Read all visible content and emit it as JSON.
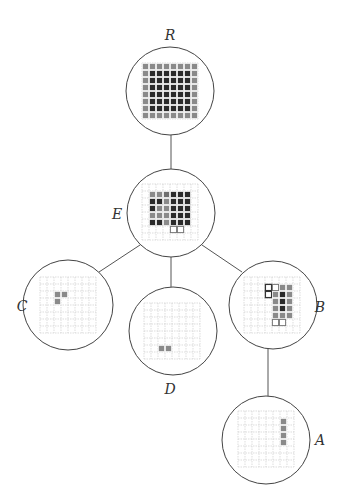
{
  "diagram": {
    "type": "tree",
    "colors": {
      "dark": "#2a2a2a",
      "gray": "#8a8a8a",
      "mid": "#6e6e6e",
      "grid": "#c8c8c8",
      "edge": "#555555",
      "circle": "#444444",
      "outline": "#777777"
    },
    "nodes": [
      {
        "id": "R",
        "label": "R",
        "cx": 170,
        "cy": 91,
        "r": 44,
        "labelX": 170,
        "labelY": 40,
        "grid": {
          "x": 142,
          "y": 63,
          "size": 7,
          "n": 8
        },
        "cells": [
          "gggggggg",
          "gddddddg",
          "gddddddg",
          "gddddddg",
          "gddddddg",
          "gddddddg",
          "gddddddg",
          "gggggggg"
        ]
      },
      {
        "id": "E",
        "label": "E",
        "cx": 171,
        "cy": 213,
        "r": 44,
        "labelX": 117,
        "labelY": 219,
        "grid": {
          "x": 142,
          "y": 184,
          "size": 7,
          "n": 8
        },
        "cells": [
          "........",
          ".ggmddd.",
          ".ddgddd.",
          ".dggddd.",
          ".gggddd.",
          ".ddgddd.",
          "....oo..",
          "........"
        ]
      },
      {
        "id": "C",
        "label": "C",
        "cx": 68,
        "cy": 305,
        "r": 45,
        "labelX": 22,
        "labelY": 311,
        "grid": {
          "x": 40,
          "y": 277,
          "size": 7,
          "n": 8
        },
        "cells": [
          "........",
          "........",
          "..gg....",
          "..g.....",
          "........",
          "........",
          "........",
          "........"
        ]
      },
      {
        "id": "D",
        "label": "D",
        "cx": 173,
        "cy": 331,
        "r": 44,
        "labelX": 170,
        "labelY": 394,
        "grid": {
          "x": 144,
          "y": 303,
          "size": 7,
          "n": 8
        },
        "cells": [
          "........",
          "........",
          "........",
          "........",
          "........",
          "........",
          "..gg....",
          "........"
        ]
      },
      {
        "id": "B",
        "label": "B",
        "cx": 273,
        "cy": 305,
        "r": 44,
        "labelX": 320,
        "labelY": 312,
        "grid": {
          "x": 244,
          "y": 277,
          "size": 7,
          "n": 8
        },
        "cells": [
          "........",
          "...Oogg.",
          "...Ogdg.",
          "....gdg.",
          "....gdg.",
          "....ggg.",
          "....oo..",
          "........"
        ]
      },
      {
        "id": "A",
        "label": "A",
        "cx": 266,
        "cy": 440,
        "r": 44,
        "labelX": 320,
        "labelY": 445,
        "grid": {
          "x": 238,
          "y": 411,
          "size": 7,
          "n": 8
        },
        "cells": [
          "........",
          "......g.",
          "......g.",
          "......g.",
          "......g.",
          "........",
          "........",
          "........"
        ]
      }
    ],
    "edges": [
      {
        "from": "R",
        "to": "E",
        "x1": 171,
        "y1": 135,
        "x2": 171,
        "y2": 169
      },
      {
        "from": "E",
        "to": "C",
        "x1": 140,
        "y1": 245,
        "x2": 99,
        "y2": 272
      },
      {
        "from": "E",
        "to": "D",
        "x1": 171,
        "y1": 257,
        "x2": 171,
        "y2": 287
      },
      {
        "from": "E",
        "to": "B",
        "x1": 202,
        "y1": 245,
        "x2": 242,
        "y2": 272
      },
      {
        "from": "B",
        "to": "A",
        "x1": 268,
        "y1": 349,
        "x2": 268,
        "y2": 396
      }
    ]
  }
}
